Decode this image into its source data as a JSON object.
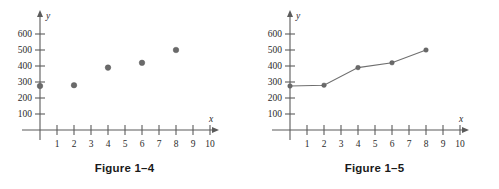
{
  "figures": [
    {
      "caption": "Figure 1–4",
      "axis": {
        "x_name": "x",
        "y_name": "y"
      }
    },
    {
      "caption": "Figure 1–5",
      "axis": {
        "x_name": "x",
        "y_name": "y"
      }
    }
  ],
  "chart_data": [
    {
      "type": "scatter",
      "title": "Figure 1–4",
      "xlabel": "x",
      "ylabel": "y",
      "x": [
        0,
        2,
        4,
        6,
        8
      ],
      "values": [
        275,
        280,
        390,
        420,
        500
      ],
      "xlim": [
        0,
        10.6
      ],
      "ylim": [
        0,
        660
      ],
      "xticks": [
        1,
        2,
        3,
        4,
        5,
        6,
        7,
        8,
        9,
        10
      ],
      "xtick_labels": [
        "1",
        "2",
        "3",
        "4",
        "5",
        "6",
        "7",
        "8",
        "9",
        "10"
      ],
      "yticks": [
        100,
        200,
        300,
        400,
        500,
        600
      ],
      "ytick_labels": [
        "100",
        "200",
        "300",
        "400",
        "500",
        "600"
      ],
      "grid": false,
      "legend": "none",
      "marker_color": "#6a6a6a"
    },
    {
      "type": "line",
      "title": "Figure 1–5",
      "xlabel": "x",
      "ylabel": "y",
      "x": [
        0,
        2,
        4,
        6,
        8
      ],
      "values": [
        275,
        280,
        390,
        420,
        500
      ],
      "xlim": [
        0,
        10.6
      ],
      "ylim": [
        0,
        660
      ],
      "xticks": [
        1,
        2,
        3,
        4,
        5,
        6,
        7,
        8,
        9,
        10
      ],
      "xtick_labels": [
        "1",
        "2",
        "3",
        "4",
        "5",
        "6",
        "7",
        "8",
        "9",
        "10"
      ],
      "yticks": [
        100,
        200,
        300,
        400,
        500,
        600
      ],
      "ytick_labels": [
        "100",
        "200",
        "300",
        "400",
        "500",
        "600"
      ],
      "grid": false,
      "legend": "none",
      "marker_color": "#6a6a6a",
      "line_color": "#6f6f6f"
    }
  ]
}
